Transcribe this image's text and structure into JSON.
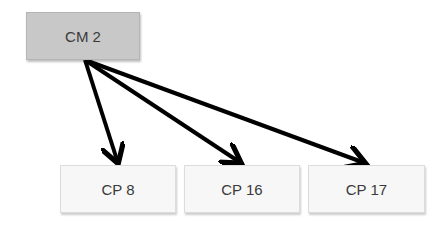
{
  "diagram": {
    "root": {
      "id": "cm2",
      "label": "CM 2"
    },
    "children": [
      {
        "id": "cp8",
        "label": "CP 8"
      },
      {
        "id": "cp16",
        "label": "CP 16"
      },
      {
        "id": "cp17",
        "label": "CP 17"
      }
    ],
    "edges": [
      {
        "from": "cm2",
        "to": "cp8"
      },
      {
        "from": "cm2",
        "to": "cp16"
      },
      {
        "from": "cm2",
        "to": "cp17"
      }
    ],
    "colors": {
      "root_fill": "#c8c8c8",
      "child_fill": "#f7f7f7",
      "arrow": "#000000"
    }
  }
}
